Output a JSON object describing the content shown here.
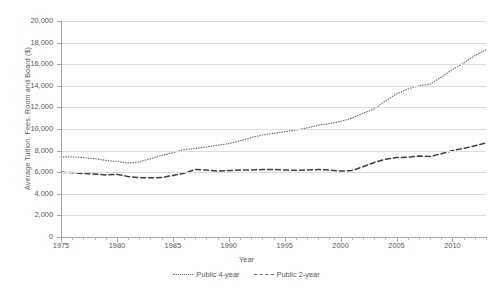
{
  "chart_data": {
    "type": "line",
    "title": "",
    "xlabel": "Year",
    "ylabel": "Average Tuition, Fees, Room and Board ($)",
    "xlim": [
      1975,
      2013
    ],
    "ylim": [
      0,
      20000
    ],
    "grid": true,
    "legend_position": "bottom",
    "x_ticks": [
      1975,
      1980,
      1985,
      1990,
      1995,
      2000,
      2005,
      2010
    ],
    "x_tick_labels": [
      "1975",
      "1980",
      "1985",
      "1990",
      "1995",
      "2000",
      "2005",
      "2010"
    ],
    "y_ticks": [
      0,
      2000,
      4000,
      6000,
      8000,
      10000,
      12000,
      14000,
      16000,
      18000,
      20000
    ],
    "y_tick_labels": [
      "0",
      "2,000",
      "4,000",
      "6,000",
      "8,000",
      "10,000",
      "12,000",
      "14,000",
      "16,000",
      "18,000",
      "20,000"
    ],
    "x": [
      1975,
      1976,
      1977,
      1978,
      1979,
      1980,
      1981,
      1982,
      1983,
      1984,
      1985,
      1986,
      1987,
      1988,
      1989,
      1990,
      1991,
      1992,
      1993,
      1994,
      1995,
      1996,
      1997,
      1998,
      1999,
      2000,
      2001,
      2002,
      2003,
      2004,
      2005,
      2006,
      2007,
      2008,
      2009,
      2010,
      2011,
      2012,
      2013
    ],
    "series": [
      {
        "name": "Public 4-year",
        "style": "dotted",
        "color": "#6b6b6b",
        "values": [
          7400,
          7420,
          7350,
          7250,
          7100,
          7000,
          6850,
          6950,
          7250,
          7550,
          7800,
          8100,
          8200,
          8350,
          8500,
          8650,
          8900,
          9200,
          9450,
          9600,
          9750,
          9900,
          10100,
          10350,
          10500,
          10700,
          11000,
          11450,
          11850,
          12600,
          13250,
          13700,
          14000,
          14150,
          14800,
          15500,
          16100,
          16800,
          17350
        ]
      },
      {
        "name": "Public 2-year",
        "style": "dashed",
        "color": "#3f3f3f",
        "values": [
          6000,
          5950,
          5880,
          5830,
          5750,
          5800,
          5600,
          5500,
          5480,
          5500,
          5700,
          5900,
          6250,
          6200,
          6100,
          6150,
          6200,
          6200,
          6250,
          6250,
          6200,
          6180,
          6200,
          6250,
          6200,
          6100,
          6150,
          6500,
          6900,
          7200,
          7350,
          7400,
          7500,
          7450,
          7700,
          8000,
          8200,
          8450,
          8700
        ]
      }
    ]
  },
  "legend": {
    "entries": [
      {
        "label": "Public 4-year",
        "marker": "dotted-line-marker"
      },
      {
        "label": "Public 2-year",
        "marker": "dashed-line-marker"
      }
    ]
  },
  "axes": {
    "x_title": "Year",
    "y_title": "Average Tuition, Fees, Room and Board ($)"
  }
}
